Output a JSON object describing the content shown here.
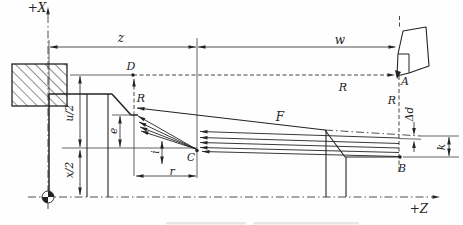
{
  "diagram": {
    "colors": {
      "ink": "#232323",
      "paper": "#fefefe",
      "smudge": "#b9b9b9"
    },
    "axis": {
      "x_label": "+X",
      "z_label": "+Z"
    },
    "geometry": {
      "styles": {
        "part": {
          "sw": 1.5
        },
        "mid": {
          "sw": 1.1
        },
        "thin": {
          "sw": 0.9
        },
        "ext": {
          "sw": 0.7
        },
        "dim": {
          "sw": 0.8
        },
        "dashdot": {
          "sw": 0.8,
          "dash": "8 3 1.5 3"
        },
        "dashed": {
          "sw": 0.85,
          "dash": "4 2.5"
        }
      },
      "chuck": {
        "x": 12,
        "y": 64,
        "w": 55,
        "h": 42
      },
      "lines": [
        {
          "name": "x-axis",
          "p": [
            48,
            209,
            48,
            9
          ],
          "s": "dashdot"
        },
        {
          "name": "z-axis",
          "p": [
            28,
            197,
            433,
            197
          ],
          "s": "dashdot"
        },
        {
          "name": "taper-extension",
          "p": [
            325,
            130,
            421,
            136
          ],
          "s": "dashdot"
        },
        {
          "name": "workpiece-face",
          "p": [
            49,
            94,
            49,
            197
          ],
          "s": "part"
        },
        {
          "name": "face-extension",
          "p": [
            49,
            40,
            49,
            94
          ],
          "s": "ext"
        },
        {
          "name": "workpiece-top",
          "p": [
            49,
            94,
            112,
            94
          ],
          "s": "part"
        },
        {
          "name": "chamfer-left",
          "p": [
            112,
            94,
            131,
            115
          ],
          "s": "part"
        },
        {
          "name": "neck-cylinder",
          "p": [
            131,
            115,
            138,
            115
          ],
          "s": "part"
        },
        {
          "name": "neck-ext",
          "p": [
            112,
            115,
            131,
            115
          ],
          "s": "ext"
        },
        {
          "name": "section-line-1",
          "p": [
            87,
            94,
            87,
            197
          ],
          "s": "mid"
        },
        {
          "name": "section-line-2",
          "p": [
            108,
            94,
            108,
            197
          ],
          "s": "mid"
        },
        {
          "name": "taper-F",
          "p": [
            137,
            108,
            325,
            130
          ],
          "s": "mid"
        },
        {
          "name": "chamfer-right",
          "p": [
            325,
            130,
            345,
            157
          ],
          "s": "mid"
        },
        {
          "name": "end-cylinder",
          "p": [
            345,
            157,
            399,
            157
          ],
          "s": "mid"
        },
        {
          "name": "section-line-3",
          "p": [
            326,
            130,
            326,
            197
          ],
          "s": "mid"
        },
        {
          "name": "section-line-4",
          "p": [
            346,
            157,
            346,
            197
          ],
          "s": "mid"
        },
        {
          "name": "cut-diagonal-1",
          "p": [
            138,
            116,
            196,
            149
          ],
          "s": "thin"
        },
        {
          "name": "cut-diagonal-2",
          "p": [
            139,
            122,
            196,
            149
          ],
          "s": "thin"
        },
        {
          "name": "cut-diagonal-3",
          "p": [
            140,
            127,
            196,
            149
          ],
          "s": "thin"
        },
        {
          "name": "cut-diagonal-4",
          "p": [
            141,
            131,
            196,
            149
          ],
          "s": "thin"
        },
        {
          "name": "pass-line-1",
          "p": [
            200,
            131.5,
            399,
            138
          ],
          "s": "thin"
        },
        {
          "name": "pass-line-2",
          "p": [
            200,
            137.5,
            399,
            143.5
          ],
          "s": "thin"
        },
        {
          "name": "pass-line-3",
          "p": [
            200,
            142.5,
            399,
            148
          ],
          "s": "thin"
        },
        {
          "name": "pass-line-4",
          "p": [
            200,
            147.5,
            399,
            152.5
          ],
          "s": "thin"
        },
        {
          "name": "pass-line-5",
          "p": [
            202,
            151.5,
            399,
            156.5
          ],
          "s": "thin"
        },
        {
          "name": "z-dim-line",
          "p": [
            50,
            47,
            196,
            47
          ],
          "s": "dim"
        },
        {
          "name": "w-dim-line",
          "p": [
            198,
            47,
            395,
            47
          ],
          "s": "dim"
        },
        {
          "name": "u2-dim-line",
          "p": [
            80,
            76,
            80,
            147
          ],
          "s": "dim"
        },
        {
          "name": "x2-dim-line",
          "p": [
            80,
            150,
            80,
            195
          ],
          "s": "dim"
        },
        {
          "name": "e-dim-line",
          "p": [
            120,
            116,
            120,
            147
          ],
          "s": "dim"
        },
        {
          "name": "i-dim-line",
          "p": [
            162,
            141,
            162,
            164
          ],
          "s": "dim"
        },
        {
          "name": "r-dim-line",
          "p": [
            136,
            176,
            196,
            176
          ],
          "s": "dim"
        },
        {
          "name": "k-dim-line",
          "p": [
            449,
            137,
            449,
            156
          ],
          "s": "dim"
        },
        {
          "name": "dd-dim-upper",
          "p": [
            414,
            122,
            414,
            130
          ],
          "s": "dim"
        },
        {
          "name": "dd-dim-lower",
          "p": [
            414,
            146,
            414,
            152
          ],
          "s": "dim"
        },
        {
          "name": "c-vertical-ext",
          "p": [
            197,
            38,
            197,
            178
          ],
          "s": "ext"
        },
        {
          "name": "c-level-line",
          "p": [
            62,
            148,
            197,
            148
          ],
          "s": "ext"
        },
        {
          "name": "d-level-solid",
          "p": [
            70,
            75,
            133,
            75
          ],
          "s": "ext"
        },
        {
          "name": "d-level-dashed",
          "p": [
            133,
            75,
            389,
            75
          ],
          "s": "dashed"
        },
        {
          "name": "retract-dashed",
          "p": [
            134,
            79,
            134,
            112
          ],
          "s": "dashed"
        },
        {
          "name": "retract-ext",
          "p": [
            134,
            112,
            134,
            176
          ],
          "s": "ext"
        },
        {
          "name": "ab-dashed",
          "p": [
            399,
            76,
            399,
            172
          ],
          "s": "dashed"
        },
        {
          "name": "ab-dashed-top",
          "p": [
            399.5,
            16,
            399.5,
            27
          ],
          "s": "dashed"
        },
        {
          "name": "k-ext-upper",
          "p": [
            421,
            136,
            459,
            136
          ],
          "s": "ext"
        },
        {
          "name": "k-ext-lower",
          "p": [
            403,
            157,
            459,
            157
          ],
          "s": "ext"
        },
        {
          "name": "pass1-extension",
          "p": [
            399,
            138.5,
            421,
            139.2
          ],
          "s": "ext"
        }
      ],
      "arrows": [
        {
          "name": "x-axis-arrow",
          "x": 48,
          "y": 7,
          "rot": -90
        },
        {
          "name": "z-axis-arrow",
          "x": 440,
          "y": 197,
          "rot": 0
        },
        {
          "name": "z-dim-arrow-left",
          "x": 50,
          "y": 47,
          "rot": 180
        },
        {
          "name": "z-dim-arrow-right",
          "x": 196,
          "y": 47,
          "rot": 0
        },
        {
          "name": "w-dim-arrow-left",
          "x": 198,
          "y": 47,
          "rot": 180
        },
        {
          "name": "w-dim-arrow-right",
          "x": 396,
          "y": 47,
          "rot": 0
        },
        {
          "name": "u2-arrow-top",
          "x": 80,
          "y": 76,
          "rot": -90
        },
        {
          "name": "u2-arrow-bottom",
          "x": 80,
          "y": 147,
          "rot": 90
        },
        {
          "name": "x2-arrow-top",
          "x": 80,
          "y": 150,
          "rot": -90
        },
        {
          "name": "x2-arrow-bottom",
          "x": 80,
          "y": 195,
          "rot": 90
        },
        {
          "name": "e-arrow-top",
          "x": 120,
          "y": 116,
          "rot": -90
        },
        {
          "name": "e-arrow-bottom",
          "x": 120,
          "y": 147,
          "rot": 90
        },
        {
          "name": "i-arrow-top",
          "x": 162,
          "y": 141,
          "rot": -90
        },
        {
          "name": "i-arrow-bottom",
          "x": 162,
          "y": 164,
          "rot": 90
        },
        {
          "name": "r-arrow-left",
          "x": 136,
          "y": 176,
          "rot": 180
        },
        {
          "name": "r-arrow-right",
          "x": 196,
          "y": 176,
          "rot": 0
        },
        {
          "name": "k-arrow-top",
          "x": 449,
          "y": 137,
          "rot": -90
        },
        {
          "name": "k-arrow-bottom",
          "x": 449,
          "y": 156,
          "rot": 90
        },
        {
          "name": "dd-arrow-down",
          "x": 414,
          "y": 135.5,
          "rot": 90
        },
        {
          "name": "dd-arrow-up",
          "x": 414,
          "y": 140.5,
          "rot": -90
        },
        {
          "name": "rapid-to-A-arrow",
          "x": 395,
          "y": 75,
          "rot": 0
        },
        {
          "name": "retract-up-arrow",
          "x": 134,
          "y": 79,
          "rot": -90
        },
        {
          "name": "feed-taper-arrow",
          "x": 137,
          "y": 108,
          "rot": 186.7
        },
        {
          "name": "diag1-arrow",
          "x": 138,
          "y": 116,
          "rot": 209.6
        },
        {
          "name": "diag2-arrow",
          "x": 139,
          "y": 122,
          "rot": 205.3
        },
        {
          "name": "diag3-arrow",
          "x": 140,
          "y": 127,
          "rot": 201.4
        },
        {
          "name": "diag4-arrow",
          "x": 141,
          "y": 131,
          "rot": 198.1
        },
        {
          "name": "pass1-arrow",
          "x": 200,
          "y": 131.5,
          "rot": 182
        },
        {
          "name": "pass2-arrow",
          "x": 200,
          "y": 137.5,
          "rot": 182
        },
        {
          "name": "pass3-arrow",
          "x": 200,
          "y": 142.5,
          "rot": 182
        },
        {
          "name": "pass4-arrow",
          "x": 200,
          "y": 147.5,
          "rot": 182
        },
        {
          "name": "pass5-arrow",
          "x": 202,
          "y": 151.5,
          "rot": 182
        }
      ],
      "dots": [
        {
          "name": "point-D-dot",
          "x": 133,
          "y": 75,
          "r": 1.7
        },
        {
          "name": "point-B-dot",
          "x": 400,
          "y": 157,
          "r": 1.8
        },
        {
          "name": "point-C-dot",
          "x": 197,
          "y": 150.5,
          "r": 1.7
        }
      ],
      "tool": {
        "outline": "M397,76 L398,54 L403,31 L426,27 L429,66 L409,73 Z",
        "inner1": [
          398,
          54,
          409,
          54
        ],
        "inner2": [
          409,
          54,
          409,
          73
        ],
        "tip": "M395,70 L401,72 L397,79 Z"
      },
      "labels": [
        {
          "name": "axis-x-label",
          "x": 37,
          "y": 8,
          "text": "+X",
          "size": 12
        },
        {
          "name": "axis-z-label",
          "x": 419,
          "y": 209,
          "text": "+Z",
          "size": 12
        },
        {
          "name": "dim-z-label",
          "x": 121,
          "y": 38,
          "text": "z",
          "size": 12
        },
        {
          "name": "dim-w-label",
          "x": 340,
          "y": 40,
          "text": "w",
          "size": 12
        },
        {
          "name": "point-D-label",
          "x": 131,
          "y": 66,
          "text": "D",
          "size": 11
        },
        {
          "name": "point-A-label",
          "x": 405,
          "y": 81,
          "text": "A",
          "size": 11
        },
        {
          "name": "point-B-label",
          "x": 402,
          "y": 168,
          "text": "B",
          "size": 11
        },
        {
          "name": "point-C-label",
          "x": 191,
          "y": 157,
          "text": "C",
          "size": 10.5
        },
        {
          "name": "rapid-R-retract-label",
          "x": 141,
          "y": 98,
          "text": "R",
          "size": 11
        },
        {
          "name": "rapid-R-return-label",
          "x": 343,
          "y": 87,
          "text": "R",
          "size": 11
        },
        {
          "name": "rapid-R-plunge-label",
          "x": 392,
          "y": 100,
          "text": "R",
          "size": 11
        },
        {
          "name": "feed-F-label",
          "x": 280,
          "y": 117,
          "text": "F",
          "size": 12
        },
        {
          "name": "dim-e-label",
          "x": 113,
          "y": 131,
          "text": "e",
          "size": 10.5,
          "rot": -90
        },
        {
          "name": "dim-i-label",
          "x": 155,
          "y": 152,
          "text": "i",
          "size": 10.5,
          "rot": -90
        },
        {
          "name": "dim-r-label",
          "x": 172,
          "y": 171,
          "text": "r",
          "size": 11
        },
        {
          "name": "dim-u2-label",
          "x": 69,
          "y": 113,
          "text": "u/2",
          "size": 10.5,
          "rot": -90
        },
        {
          "name": "dim-x2-label",
          "x": 69,
          "y": 170,
          "text": "x/2",
          "size": 10.5,
          "rot": -90
        },
        {
          "name": "dim-dd-label",
          "x": 409,
          "y": 114,
          "text": "Δd",
          "size": 10.5,
          "rot": -90
        },
        {
          "name": "dim-k-label",
          "x": 441,
          "y": 147,
          "text": "k",
          "size": 10.5,
          "rot": -90
        }
      ],
      "origin": {
        "x": 48,
        "y": 197,
        "r": 6
      },
      "caption_smudges": [
        {
          "x": 166,
          "y": 222,
          "w": 80,
          "h": 2.6
        },
        {
          "x": 253,
          "y": 222,
          "w": 106,
          "h": 2.6
        }
      ]
    }
  }
}
